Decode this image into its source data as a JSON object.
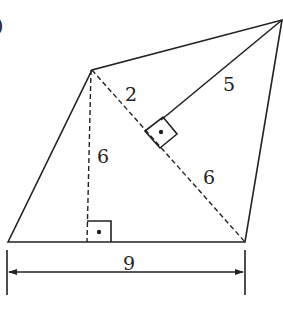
{
  "figure": {
    "type": "quadrilateral-area-diagram",
    "partial_label_top_left": ")",
    "labels": {
      "dist_top_to_diagonal_segment": "2",
      "perpendicular_to_diagonal": "5",
      "height_left": "6",
      "diagonal_lower_segment": "6",
      "base_width": "9"
    },
    "colors": {
      "stroke": "#222222",
      "background": "#ffffff"
    }
  }
}
